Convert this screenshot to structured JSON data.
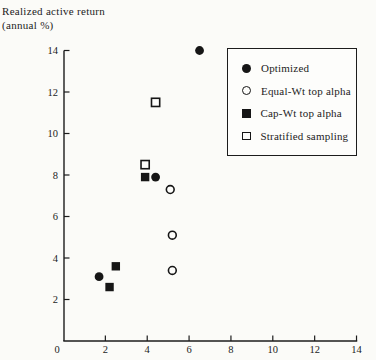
{
  "title": {
    "line1": "Realized active return",
    "line2": "(annual %)"
  },
  "colors": {
    "foreground": "#1c1c1c",
    "marker": "#161616",
    "background": "#fbfbf8",
    "legend_background": "#fdfdfb"
  },
  "legend": {
    "items": [
      {
        "label": "Optimized",
        "marker": "filled-circle"
      },
      {
        "label": "Equal-Wt top alpha",
        "marker": "open-circle"
      },
      {
        "label": "Cap-Wt top alpha",
        "marker": "filled-square"
      },
      {
        "label": "Stratified sampling",
        "marker": "open-square"
      }
    ]
  },
  "chart_data": {
    "type": "scatter",
    "title": "Realized active return (annual %)",
    "xlabel": "",
    "ylabel": "Realized active return (annual %)",
    "xlim": [
      0,
      14
    ],
    "ylim": [
      0,
      14
    ],
    "x_ticks": [
      0,
      2,
      4,
      6,
      8,
      10,
      12,
      14
    ],
    "y_ticks": [
      2,
      4,
      6,
      8,
      10,
      12,
      14
    ],
    "grid": false,
    "legend_position": "upper right",
    "series": [
      {
        "name": "Optimized",
        "marker": "filled-circle",
        "points": [
          [
            1.7,
            3.1
          ],
          [
            4.4,
            7.9
          ],
          [
            6.5,
            14.0
          ]
        ]
      },
      {
        "name": "Equal-Wt top alpha",
        "marker": "open-circle",
        "points": [
          [
            5.1,
            7.3
          ],
          [
            5.2,
            5.1
          ],
          [
            5.2,
            3.4
          ]
        ]
      },
      {
        "name": "Cap-Wt top alpha",
        "marker": "filled-square",
        "points": [
          [
            2.2,
            2.6
          ],
          [
            2.5,
            3.6
          ],
          [
            3.9,
            7.9
          ]
        ]
      },
      {
        "name": "Stratified sampling",
        "marker": "open-square",
        "points": [
          [
            3.9,
            8.5
          ],
          [
            4.4,
            11.5
          ]
        ]
      }
    ]
  }
}
